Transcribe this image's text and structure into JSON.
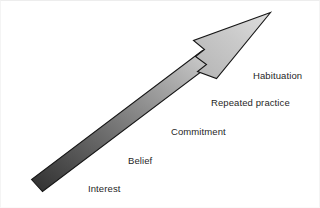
{
  "diagram": {
    "type": "ascending-arrow-progression",
    "title_visible": false,
    "canvas": {
      "width": 320,
      "height": 208,
      "background_color": "#ffffff",
      "border_color": "#ededed"
    },
    "arrow": {
      "name": "progression-arrow",
      "direction": "up-right",
      "outline_color": "#1a1a1a",
      "gradient_start_color": "#333333",
      "gradient_end_color": "#d0d0d0",
      "head_fill_color": "#c4c4c4",
      "tail_point": {
        "x": 30,
        "y": 190
      },
      "tip_point": {
        "x": 270,
        "y": 12
      }
    },
    "stages": [
      {
        "label": "Habituation",
        "order": 5
      },
      {
        "label": "Repeated practice",
        "order": 4
      },
      {
        "label": "Commitment",
        "order": 3
      },
      {
        "label": "Belief",
        "order": 2
      },
      {
        "label": "Interest",
        "order": 1
      }
    ]
  }
}
